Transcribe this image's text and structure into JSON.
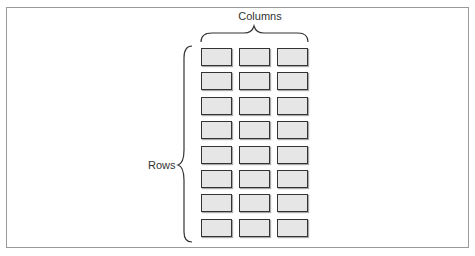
{
  "diagram": {
    "columns_label": "Columns",
    "rows_label": "Rows",
    "grid": {
      "rows": 8,
      "columns": 3
    }
  }
}
